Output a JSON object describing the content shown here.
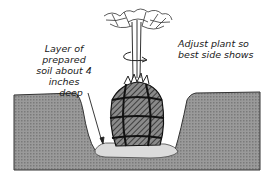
{
  "labels": {
    "soil_layer": [
      "Layer of prepared",
      "soil about 4 inches",
      "deep"
    ],
    "adjust": [
      "Adjust plant so",
      "best side shows"
    ]
  },
  "colors": {
    "ground": "#8a8a8a",
    "soil_layer": "#d9d9d9",
    "root_ball": "#6e6e6e",
    "ink": "#1a1a1a",
    "background": "#ffffff"
  }
}
